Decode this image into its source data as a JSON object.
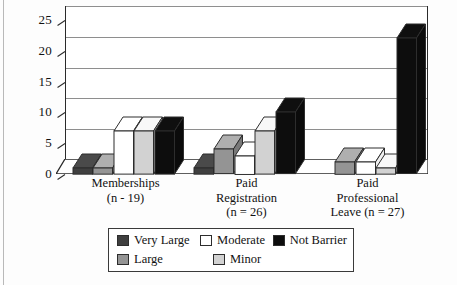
{
  "chart_data": {
    "type": "bar",
    "title": "",
    "subtitle": "",
    "xlabel": "",
    "ylabel": "",
    "ylim": [
      0,
      25
    ],
    "yticks": [
      0,
      5,
      10,
      15,
      20,
      25
    ],
    "grid": true,
    "legend_position": "bottom",
    "style": "3d-clustered-column",
    "categories": [
      "Memberships\n(n - 19)",
      "Paid\nRegistration\n(n = 26)",
      "Paid\nProfessional\nLeave (n = 27)"
    ],
    "series": [
      {
        "name": "Very Large",
        "color": "#3f3f3f",
        "values": [
          1,
          1,
          0
        ]
      },
      {
        "name": "Large",
        "color": "#949494",
        "values": [
          1,
          4,
          2
        ]
      },
      {
        "name": "Moderate",
        "color": "#ffffff",
        "values": [
          7,
          3,
          2
        ]
      },
      {
        "name": "Minor",
        "color": "#d2d2d2",
        "values": [
          7,
          7,
          1
        ]
      },
      {
        "name": "Not Barrier",
        "color": "#0d0d0d",
        "values": [
          7,
          10,
          22
        ]
      }
    ]
  },
  "axis": {
    "y_tick_labels": [
      "0",
      "5",
      "10",
      "15",
      "20",
      "25"
    ]
  },
  "groups": [
    {
      "lines": [
        "Memberships",
        "(n - 19)"
      ]
    },
    {
      "lines": [
        "Paid",
        "Registration",
        "(n = 26)"
      ]
    },
    {
      "lines": [
        "Paid",
        "Professional",
        "Leave (n = 27)"
      ]
    }
  ],
  "legend": {
    "entries": [
      {
        "label": "Very Large",
        "color": "#3f3f3f"
      },
      {
        "label": "Moderate",
        "color": "#ffffff"
      },
      {
        "label": "Not Barrier",
        "color": "#0d0d0d"
      },
      {
        "label": "Large",
        "color": "#949494"
      },
      {
        "label": "Minor",
        "color": "#d2d2d2"
      }
    ]
  },
  "colors": {
    "very_large": "#3f3f3f",
    "large": "#949494",
    "moderate": "#ffffff",
    "minor": "#d2d2d2",
    "not_barrier": "#0d0d0d",
    "axis": "#2a2a2a",
    "gridline": "#8e8e8e",
    "plot_background": "#ffffff",
    "page_background": "#fdfdfd"
  }
}
